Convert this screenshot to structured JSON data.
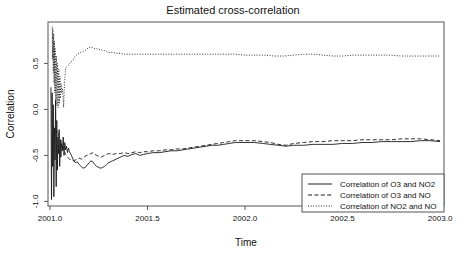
{
  "chart_data": {
    "type": "line",
    "title": "Estimated cross-correlation",
    "xlabel": "Time",
    "ylabel": "Correlation",
    "xlim": [
      2000.99,
      2003.02
    ],
    "ylim": [
      -1.05,
      0.95
    ],
    "grid": false,
    "legend_position": "bottom-right",
    "xticks": [
      2001.0,
      2001.5,
      2002.0,
      2002.5,
      2003.0
    ],
    "xticklabels": [
      "2001.0",
      "2001.5",
      "2002.0",
      "2002.5",
      "2003.0"
    ],
    "yticks": [
      0.5,
      0.0,
      -0.5,
      -1.0
    ],
    "yticklabels": [
      "0.5",
      "0.0",
      "-0.5",
      "-1.0"
    ],
    "series": [
      {
        "name": "Correlation of O3 and NO2",
        "style": "solid",
        "x": [
          2001.005,
          2001.008,
          2001.011,
          2001.014,
          2001.017,
          2001.02,
          2001.023,
          2001.026,
          2001.029,
          2001.032,
          2001.035,
          2001.038,
          2001.041,
          2001.044,
          2001.047,
          2001.05,
          2001.053,
          2001.056,
          2001.06,
          2001.064,
          2001.068,
          2001.072,
          2001.076,
          2001.08,
          2001.085,
          2001.09,
          2001.095,
          2001.1,
          2001.11,
          2001.12,
          2001.13,
          2001.14,
          2001.15,
          2001.16,
          2001.17,
          2001.18,
          2001.19,
          2001.2,
          2001.21,
          2001.22,
          2001.23,
          2001.24,
          2001.25,
          2001.26,
          2001.27,
          2001.28,
          2001.29,
          2001.3,
          2001.32,
          2001.34,
          2001.36,
          2001.38,
          2001.4,
          2001.42,
          2001.44,
          2001.46,
          2001.48,
          2001.5,
          2001.53,
          2001.56,
          2001.59,
          2001.62,
          2001.65,
          2001.68,
          2001.71,
          2001.74,
          2001.77,
          2001.8,
          2001.83,
          2001.86,
          2001.89,
          2001.92,
          2001.95,
          2001.98,
          2002.01,
          2002.05,
          2002.09,
          2002.13,
          2002.17,
          2002.21,
          2002.25,
          2002.3,
          2002.35,
          2002.4,
          2002.45,
          2002.5,
          2002.55,
          2002.6,
          2002.65,
          2002.7,
          2002.75,
          2002.8,
          2002.85,
          2002.9,
          2002.95,
          2003.0
        ],
        "y": [
          0.24,
          -0.98,
          0.18,
          -0.62,
          0.05,
          -0.95,
          -0.2,
          -0.55,
          0.1,
          -0.84,
          -0.12,
          -0.66,
          -0.3,
          -0.48,
          -0.22,
          -0.62,
          -0.33,
          -0.52,
          -0.37,
          -0.45,
          -0.3,
          -0.5,
          -0.36,
          -0.44,
          -0.4,
          -0.47,
          -0.42,
          -0.46,
          -0.5,
          -0.55,
          -0.58,
          -0.57,
          -0.6,
          -0.62,
          -0.64,
          -0.63,
          -0.61,
          -0.58,
          -0.56,
          -0.57,
          -0.6,
          -0.62,
          -0.63,
          -0.64,
          -0.63,
          -0.62,
          -0.6,
          -0.58,
          -0.56,
          -0.54,
          -0.52,
          -0.5,
          -0.51,
          -0.49,
          -0.48,
          -0.5,
          -0.49,
          -0.48,
          -0.47,
          -0.47,
          -0.46,
          -0.45,
          -0.45,
          -0.44,
          -0.43,
          -0.42,
          -0.41,
          -0.4,
          -0.39,
          -0.39,
          -0.38,
          -0.37,
          -0.36,
          -0.36,
          -0.36,
          -0.36,
          -0.37,
          -0.38,
          -0.39,
          -0.4,
          -0.39,
          -0.39,
          -0.38,
          -0.38,
          -0.38,
          -0.37,
          -0.37,
          -0.36,
          -0.36,
          -0.35,
          -0.35,
          -0.35,
          -0.35,
          -0.34,
          -0.34,
          -0.35
        ]
      },
      {
        "name": "Correlation of O3 and NO",
        "style": "dashed",
        "x": [
          2001.03,
          2001.035,
          2001.04,
          2001.045,
          2001.05,
          2001.055,
          2001.06,
          2001.065,
          2001.07,
          2001.075,
          2001.08,
          2001.085,
          2001.09,
          2001.095,
          2001.1,
          2001.11,
          2001.12,
          2001.13,
          2001.14,
          2001.15,
          2001.16,
          2001.17,
          2001.18,
          2001.19,
          2001.2,
          2001.21,
          2001.22,
          2001.23,
          2001.24,
          2001.25,
          2001.26,
          2001.27,
          2001.28,
          2001.29,
          2001.3,
          2001.32,
          2001.34,
          2001.36,
          2001.38,
          2001.4,
          2001.42,
          2001.44,
          2001.46,
          2001.48,
          2001.5,
          2001.53,
          2001.56,
          2001.59,
          2001.62,
          2001.65,
          2001.68,
          2001.71,
          2001.74,
          2001.77,
          2001.8,
          2001.83,
          2001.86,
          2001.89,
          2001.92,
          2001.95,
          2001.98,
          2002.01,
          2002.05,
          2002.09,
          2002.13,
          2002.17,
          2002.21,
          2002.25,
          2002.3,
          2002.35,
          2002.4,
          2002.45,
          2002.5,
          2002.55,
          2002.6,
          2002.65,
          2002.7,
          2002.75,
          2002.8,
          2002.85,
          2002.9,
          2002.95,
          2003.0
        ],
        "y": [
          -0.22,
          -0.25,
          -0.24,
          -0.28,
          -0.3,
          -0.33,
          -0.36,
          -0.4,
          -0.43,
          -0.46,
          -0.49,
          -0.5,
          -0.52,
          -0.53,
          -0.54,
          -0.55,
          -0.56,
          -0.55,
          -0.54,
          -0.53,
          -0.54,
          -0.53,
          -0.51,
          -0.5,
          -0.49,
          -0.48,
          -0.47,
          -0.49,
          -0.5,
          -0.51,
          -0.52,
          -0.51,
          -0.5,
          -0.49,
          -0.48,
          -0.49,
          -0.48,
          -0.48,
          -0.47,
          -0.48,
          -0.47,
          -0.46,
          -0.47,
          -0.46,
          -0.46,
          -0.45,
          -0.45,
          -0.44,
          -0.44,
          -0.43,
          -0.43,
          -0.42,
          -0.41,
          -0.4,
          -0.39,
          -0.38,
          -0.37,
          -0.36,
          -0.35,
          -0.34,
          -0.34,
          -0.34,
          -0.34,
          -0.35,
          -0.36,
          -0.38,
          -0.39,
          -0.37,
          -0.36,
          -0.35,
          -0.35,
          -0.34,
          -0.34,
          -0.34,
          -0.33,
          -0.33,
          -0.33,
          -0.33,
          -0.32,
          -0.32,
          -0.32,
          -0.33,
          -0.34
        ]
      },
      {
        "name": "Correlation of NO2 and NO",
        "style": "dotted",
        "x": [
          2001.012,
          2001.013,
          2001.015,
          2001.017,
          2001.019,
          2001.021,
          2001.023,
          2001.025,
          2001.027,
          2001.03,
          2001.033,
          2001.036,
          2001.039,
          2001.042,
          2001.045,
          2001.048,
          2001.051,
          2001.054,
          2001.057,
          2001.06,
          2001.065,
          2001.07,
          2001.075,
          2001.08,
          2001.085,
          2001.09,
          2001.095,
          2001.1,
          2001.11,
          2001.12,
          2001.13,
          2001.14,
          2001.15,
          2001.16,
          2001.17,
          2001.18,
          2001.19,
          2001.2,
          2001.21,
          2001.22,
          2001.23,
          2001.24,
          2001.25,
          2001.26,
          2001.27,
          2001.28,
          2001.29,
          2001.3,
          2001.32,
          2001.34,
          2001.36,
          2001.38,
          2001.4,
          2001.45,
          2001.5,
          2001.55,
          2001.6,
          2001.65,
          2001.7,
          2001.75,
          2001.8,
          2001.85,
          2001.9,
          2001.95,
          2002.0,
          2002.05,
          2002.1,
          2002.15,
          2002.2,
          2002.25,
          2002.3,
          2002.35,
          2002.4,
          2002.45,
          2002.5,
          2002.55,
          2002.6,
          2002.65,
          2002.7,
          2002.75,
          2002.8,
          2002.85,
          2002.9,
          2002.95,
          2003.0
        ],
        "y": [
          0.9,
          0.55,
          0.88,
          0.4,
          0.82,
          0.28,
          0.74,
          0.18,
          0.66,
          0.1,
          0.58,
          0.04,
          0.5,
          0.02,
          0.44,
          0.06,
          0.36,
          0.12,
          0.28,
          0.18,
          0.22,
          0.02,
          0.3,
          0.44,
          0.46,
          0.47,
          0.48,
          0.5,
          0.52,
          0.54,
          0.58,
          0.6,
          0.61,
          0.62,
          0.63,
          0.64,
          0.66,
          0.67,
          0.68,
          0.67,
          0.66,
          0.66,
          0.65,
          0.65,
          0.64,
          0.64,
          0.63,
          0.62,
          0.62,
          0.61,
          0.61,
          0.6,
          0.6,
          0.6,
          0.6,
          0.6,
          0.6,
          0.6,
          0.6,
          0.6,
          0.6,
          0.6,
          0.6,
          0.6,
          0.59,
          0.59,
          0.59,
          0.58,
          0.58,
          0.59,
          0.6,
          0.6,
          0.59,
          0.58,
          0.58,
          0.59,
          0.59,
          0.59,
          0.59,
          0.59,
          0.58,
          0.58,
          0.58,
          0.58,
          0.58
        ]
      }
    ]
  }
}
